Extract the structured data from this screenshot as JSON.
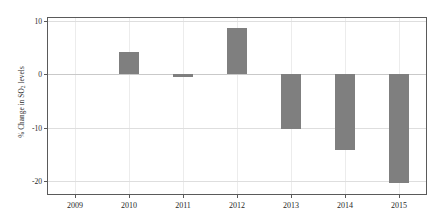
{
  "chart_data": {
    "type": "bar",
    "title": "",
    "subtitle": "",
    "xlabel": "",
    "ylabel": "% Change in SO2 levels",
    "ylabel_parts": {
      "pre": "% Change in SO",
      "sub": "2",
      "post": " levels"
    },
    "categories": [
      "2009",
      "2010",
      "2011",
      "2012",
      "2013",
      "2014",
      "2015"
    ],
    "values": [
      0,
      4.2,
      -0.5,
      8.7,
      -10.3,
      -14.3,
      -20.5
    ],
    "series": [
      {
        "name": "% Change in SO2 levels",
        "values": [
          0,
          4.2,
          -0.5,
          8.7,
          -10.3,
          -14.3,
          -20.5
        ]
      }
    ],
    "xlim": [
      2008.5,
      2015.5
    ],
    "ylim": [
      -22.5,
      10.6
    ],
    "yticks": [
      10,
      0,
      -10,
      -20
    ],
    "ytick_labels": [
      "10",
      "0",
      "-10",
      "-20"
    ],
    "xticks": [
      2009,
      2010,
      2011,
      2012,
      2013,
      2014,
      2015
    ],
    "xtick_labels": [
      "2009",
      "2010",
      "2011",
      "2012",
      "2013",
      "2014",
      "2015"
    ],
    "grid": true,
    "grid_axis": "both",
    "legend": false,
    "legend_position": "none",
    "bar_color": "#7f7f7f",
    "grid_color": "#dedede",
    "axis_color": "#5a5a5a",
    "background_color": "#ffffff",
    "annotations": []
  }
}
